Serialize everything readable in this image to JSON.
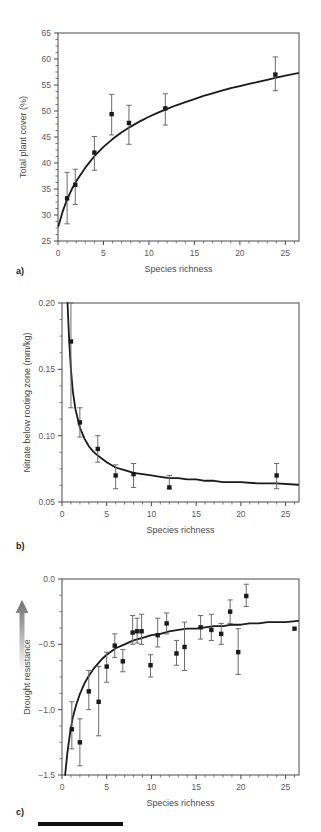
{
  "figure": {
    "panel_count": 3,
    "background": "#ffffff",
    "line_color": "#1a1a1a",
    "marker_color": "#1a1a1a",
    "errorbar_color": "#6b6b6b",
    "axis_color": "#4a4a4a",
    "footer_bar_color": "#111111"
  },
  "panels": {
    "a": {
      "tag": "a)"
    },
    "b": {
      "tag": "b)"
    },
    "c": {
      "tag": "c)",
      "arrow_icon": "up-arrow-gradient-icon"
    }
  },
  "chart_data": [
    {
      "type": "scatter",
      "panel": "a",
      "title": "",
      "xlabel": "Species richness",
      "ylabel": "Total plant cover (%)",
      "xlim": [
        0,
        26.5
      ],
      "ylim": [
        25,
        65
      ],
      "xticks": [
        0,
        5,
        10,
        15,
        20,
        25
      ],
      "yticks": [
        25,
        30,
        35,
        40,
        45,
        50,
        55,
        60,
        65
      ],
      "xtick_labels": [
        "0",
        "5",
        "10",
        "15",
        "20",
        "25"
      ],
      "ytick_labels": [
        "25",
        "30",
        "35",
        "40",
        "45",
        "50",
        "55",
        "60",
        "65"
      ],
      "grid": false,
      "legend": "none",
      "points": [
        {
          "x": 1,
          "y": 33.2,
          "err_low": 28.3,
          "err_high": 38.2
        },
        {
          "x": 1.9,
          "y": 35.8,
          "err_low": 32.0,
          "err_high": 38.8
        },
        {
          "x": 4,
          "y": 42.0,
          "err_low": 38.6,
          "err_high": 45.1
        },
        {
          "x": 5.9,
          "y": 49.4,
          "err_low": 45.4,
          "err_high": 53.2
        },
        {
          "x": 7.8,
          "y": 47.7,
          "err_low": 43.6,
          "err_high": 51.1
        },
        {
          "x": 11.8,
          "y": 50.5,
          "err_low": 47.3,
          "err_high": 53.3
        },
        {
          "x": 23.9,
          "y": 57.0,
          "err_low": 53.9,
          "err_high": 60.4
        }
      ],
      "fit_curve": {
        "form": "saturating",
        "description": "Total cover rises steeply then saturates near 57-58%",
        "points": [
          [
            0.05,
            27.9
          ],
          [
            0.5,
            30.6
          ],
          [
            1,
            33.0
          ],
          [
            1.5,
            34.9
          ],
          [
            2,
            36.5
          ],
          [
            3,
            39.1
          ],
          [
            4,
            41.3
          ],
          [
            5,
            43.1
          ],
          [
            6,
            44.6
          ],
          [
            7,
            45.9
          ],
          [
            8,
            47.0
          ],
          [
            9,
            48.0
          ],
          [
            10,
            48.9
          ],
          [
            11,
            49.7
          ],
          [
            12,
            50.4
          ],
          [
            13,
            51.1
          ],
          [
            14,
            51.7
          ],
          [
            15,
            52.3
          ],
          [
            16,
            52.9
          ],
          [
            17,
            53.4
          ],
          [
            18,
            53.9
          ],
          [
            19,
            54.4
          ],
          [
            20,
            54.8
          ],
          [
            21,
            55.2
          ],
          [
            22,
            55.6
          ],
          [
            23,
            56.0
          ],
          [
            24,
            56.4
          ],
          [
            25,
            56.8
          ],
          [
            26.4,
            57.3
          ]
        ]
      }
    },
    {
      "type": "scatter",
      "panel": "b",
      "title": "",
      "xlabel": "Species richness",
      "ylabel": "Nitrate below rooting zone (mm/kg)",
      "xlim": [
        0,
        26.5
      ],
      "ylim": [
        0.05,
        0.2
      ],
      "xticks": [
        0,
        5,
        10,
        15,
        20,
        25
      ],
      "yticks": [
        0.05,
        0.1,
        0.15,
        0.2
      ],
      "xtick_labels": [
        "0",
        "5",
        "10",
        "15",
        "20",
        "25"
      ],
      "ytick_labels": [
        "0.05",
        "0.10",
        "0.15",
        "0.20"
      ],
      "grid": false,
      "legend": "none",
      "points": [
        {
          "x": 1,
          "y": 0.171,
          "err_low": 0.121,
          "err_high": 0.2
        },
        {
          "x": 2,
          "y": 0.11,
          "err_low": 0.099,
          "err_high": 0.121
        },
        {
          "x": 4,
          "y": 0.09,
          "err_low": 0.08,
          "err_high": 0.1
        },
        {
          "x": 6,
          "y": 0.07,
          "err_low": 0.06,
          "err_high": 0.078
        },
        {
          "x": 8,
          "y": 0.071,
          "err_low": 0.061,
          "err_high": 0.079
        },
        {
          "x": 12,
          "y": 0.061,
          "err_low": 0.06,
          "err_high": 0.07
        },
        {
          "x": 24,
          "y": 0.07,
          "err_low": 0.06,
          "err_high": 0.079
        }
      ],
      "fit_curve": {
        "form": "decay",
        "description": "Nitrate falls sharply from above 0.20 then levels at ~0.063",
        "points": [
          [
            0.62,
            0.2
          ],
          [
            0.8,
            0.172
          ],
          [
            1,
            0.15
          ],
          [
            1.2,
            0.134
          ],
          [
            1.5,
            0.12
          ],
          [
            2,
            0.106
          ],
          [
            2.5,
            0.098
          ],
          [
            3,
            0.092
          ],
          [
            3.5,
            0.088
          ],
          [
            4,
            0.085
          ],
          [
            5,
            0.08
          ],
          [
            6,
            0.076
          ],
          [
            7,
            0.074
          ],
          [
            8,
            0.072
          ],
          [
            9,
            0.071
          ],
          [
            10,
            0.07
          ],
          [
            11,
            0.069
          ],
          [
            12,
            0.068
          ],
          [
            13,
            0.068
          ],
          [
            14,
            0.067
          ],
          [
            15,
            0.067
          ],
          [
            16,
            0.066
          ],
          [
            17,
            0.066
          ],
          [
            18,
            0.065
          ],
          [
            19,
            0.065
          ],
          [
            20,
            0.065
          ],
          [
            22,
            0.064
          ],
          [
            24,
            0.064
          ],
          [
            26.4,
            0.063
          ]
        ]
      }
    },
    {
      "type": "scatter",
      "panel": "c",
      "title": "",
      "xlabel": "Species richness",
      "ylabel": "Drought resistance",
      "xlim": [
        0,
        26.5
      ],
      "ylim": [
        -1.5,
        0.0
      ],
      "xticks": [
        0,
        5,
        10,
        15,
        20,
        25
      ],
      "yticks": [
        -1.5,
        -1.0,
        -0.5,
        0.0
      ],
      "xtick_labels": [
        "0",
        "5",
        "10",
        "15",
        "20",
        "25"
      ],
      "ytick_labels": [
        "−1.5",
        "−1.0",
        "−0.5",
        "0.0"
      ],
      "grid": false,
      "legend": "none",
      "points": [
        {
          "x": 1.1,
          "y": -1.15,
          "err_low": -1.3,
          "err_high": -0.94
        },
        {
          "x": 2.0,
          "y": -1.25,
          "err_low": -1.43,
          "err_high": -1.07
        },
        {
          "x": 3.0,
          "y": -0.86,
          "err_low": -1.0,
          "err_high": -0.7
        },
        {
          "x": 4.1,
          "y": -0.94,
          "err_low": -1.2,
          "err_high": -0.67
        },
        {
          "x": 5.0,
          "y": -0.67,
          "err_low": -0.79,
          "err_high": -0.56
        },
        {
          "x": 5.9,
          "y": -0.51,
          "err_low": -0.6,
          "err_high": -0.42
        },
        {
          "x": 6.8,
          "y": -0.63,
          "err_low": -0.71,
          "err_high": -0.54
        },
        {
          "x": 7.9,
          "y": -0.41,
          "err_low": -0.5,
          "err_high": -0.28
        },
        {
          "x": 8.4,
          "y": -0.4,
          "err_low": -0.49,
          "err_high": -0.3
        },
        {
          "x": 8.9,
          "y": -0.4,
          "err_low": -0.5,
          "err_high": -0.27
        },
        {
          "x": 9.9,
          "y": -0.66,
          "err_low": -0.75,
          "err_high": -0.58
        },
        {
          "x": 10.7,
          "y": -0.43,
          "err_low": -0.52,
          "err_high": -0.3
        },
        {
          "x": 11.7,
          "y": -0.34,
          "err_low": -0.42,
          "err_high": -0.26
        },
        {
          "x": 12.8,
          "y": -0.57,
          "err_low": -0.66,
          "err_high": -0.47
        },
        {
          "x": 13.7,
          "y": -0.52,
          "err_low": -0.7,
          "err_high": -0.33
        },
        {
          "x": 15.5,
          "y": -0.37,
          "err_low": -0.46,
          "err_high": -0.28
        },
        {
          "x": 16.7,
          "y": -0.39,
          "err_low": -0.47,
          "err_high": -0.27
        },
        {
          "x": 17.8,
          "y": -0.42,
          "err_low": -0.5,
          "err_high": -0.34
        },
        {
          "x": 18.8,
          "y": -0.25,
          "err_low": -0.34,
          "err_high": -0.16
        },
        {
          "x": 19.7,
          "y": -0.56,
          "err_low": -0.73,
          "err_high": -0.38
        },
        {
          "x": 20.6,
          "y": -0.13,
          "err_low": -0.21,
          "err_high": -0.04
        },
        {
          "x": 26.0,
          "y": -0.38,
          "err_low": -0.38,
          "err_high": -0.38
        }
      ],
      "fit_curve": {
        "form": "saturating",
        "description": "Drought resistance rises steeply from -1.5 and saturates near -0.32",
        "points": [
          [
            0.35,
            -1.5
          ],
          [
            0.6,
            -1.33
          ],
          [
            0.9,
            -1.18
          ],
          [
            1.2,
            -1.06
          ],
          [
            1.6,
            -0.96
          ],
          [
            2,
            -0.88
          ],
          [
            2.5,
            -0.8
          ],
          [
            3,
            -0.74
          ],
          [
            3.5,
            -0.69
          ],
          [
            4,
            -0.65
          ],
          [
            4.5,
            -0.61
          ],
          [
            5,
            -0.58
          ],
          [
            6,
            -0.53
          ],
          [
            7,
            -0.5
          ],
          [
            8,
            -0.47
          ],
          [
            9,
            -0.45
          ],
          [
            10,
            -0.43
          ],
          [
            11,
            -0.42
          ],
          [
            12,
            -0.4
          ],
          [
            13,
            -0.39
          ],
          [
            14,
            -0.38
          ],
          [
            15,
            -0.38
          ],
          [
            16,
            -0.37
          ],
          [
            17,
            -0.36
          ],
          [
            18,
            -0.36
          ],
          [
            19,
            -0.35
          ],
          [
            20,
            -0.35
          ],
          [
            21,
            -0.34
          ],
          [
            22,
            -0.34
          ],
          [
            23,
            -0.33
          ],
          [
            24,
            -0.33
          ],
          [
            25,
            -0.33
          ],
          [
            26.4,
            -0.32
          ]
        ]
      }
    }
  ]
}
